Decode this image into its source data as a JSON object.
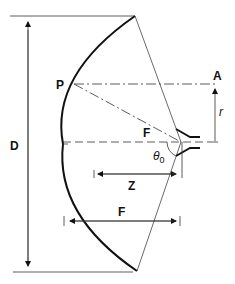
{
  "diagram": {
    "labels": {
      "diameter": "D",
      "point": "P",
      "aperture_point": "A",
      "radius": "r",
      "focus": "F",
      "angle_base": "θ",
      "angle_sub": "0",
      "offset": "Z",
      "focal_length": "F"
    },
    "colors": {
      "line": "#111111",
      "dish": "#111111",
      "background": "#ffffff"
    }
  }
}
